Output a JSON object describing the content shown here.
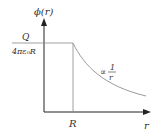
{
  "diagram": {
    "y_axis_label": "ϕ(r)",
    "x_axis_label": "r",
    "x_tick_label": "R",
    "y_level_numerator": "Q",
    "y_level_denominator": "4πε₀R",
    "curve_label_prefix": "∝",
    "curve_label_numerator": "1",
    "curve_label_denominator": "r",
    "colors": {
      "axis": "#222222",
      "curve": "#9a9a9a",
      "guide": "#888888",
      "text": "#333333"
    }
  }
}
